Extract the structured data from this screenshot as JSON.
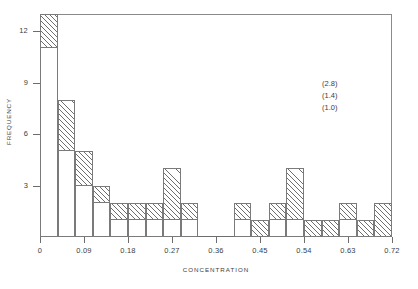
{
  "chart_data": {
    "type": "bar",
    "title": "",
    "xlabel": "CONCENTRATION",
    "ylabel": "FREQUENCY",
    "xlim": [
      0,
      0.72
    ],
    "ylim": [
      0,
      13
    ],
    "grid": false,
    "legend": null,
    "bin_width": 0.036,
    "xticks": [
      "0",
      "0.09",
      "0.18",
      "0.27",
      "0.36",
      "0.45",
      "0.54",
      "0.63",
      "0.72"
    ],
    "xtick_values": [
      0,
      0.09,
      0.18,
      0.27,
      0.36,
      0.45,
      0.54,
      0.63,
      0.72
    ],
    "yticks": [
      "3",
      "6",
      "9",
      "12"
    ],
    "ytick_values": [
      3,
      6,
      9,
      12
    ],
    "categories": [
      "0.000",
      "0.036",
      "0.072",
      "0.108",
      "0.144",
      "0.180",
      "0.216",
      "0.252",
      "0.288",
      "0.324",
      "0.360",
      "0.396",
      "0.432",
      "0.468",
      "0.504",
      "0.540",
      "0.576",
      "0.612",
      "0.648",
      "0.684"
    ],
    "values": [
      13,
      8,
      5,
      3,
      2,
      2,
      2,
      4,
      2,
      0,
      0,
      2,
      1,
      2,
      4,
      1,
      1,
      2,
      1,
      0
    ],
    "inner_values": [
      11,
      5,
      3,
      2,
      1,
      1,
      1,
      1,
      1,
      0,
      0,
      1,
      0,
      1,
      1,
      0,
      0,
      1,
      0,
      0
    ],
    "annotations": [
      "(2.8)",
      "(1.4)",
      "(1.0)"
    ],
    "outlier_bar": {
      "x": "0.72",
      "value": 2
    }
  },
  "axes": {
    "ylabel": "FREQUENCY",
    "xlabel": "CONCENTRATION"
  }
}
